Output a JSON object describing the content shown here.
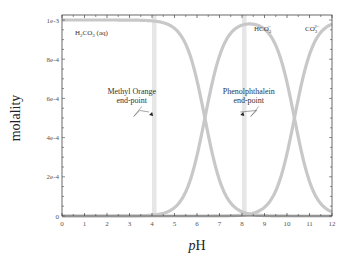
{
  "chart_data": {
    "type": "line",
    "title": "",
    "xlabel": "pH",
    "ylabel": "molality",
    "xlim": [
      0,
      12
    ],
    "ylim": [
      0,
      0.001
    ],
    "x_ticks": [
      "0",
      "1",
      "2",
      "3",
      "4",
      "5",
      "6",
      "7",
      "8",
      "9",
      "10",
      "11",
      "12"
    ],
    "y_ticks": [
      {
        "value": 0,
        "label": "0"
      },
      {
        "value": 0.0002,
        "label": "2e-4"
      },
      {
        "value": 0.0004,
        "label": "4e-4"
      },
      {
        "value": 0.0006,
        "label": "6e-4"
      },
      {
        "value": 0.0008,
        "label": "8e-4"
      },
      {
        "value": 0.001,
        "label": "1e-3"
      }
    ],
    "grid": false,
    "legend": "none (inline species labels)",
    "model": {
      "total_molality": 0.001,
      "pKa1": 6.35,
      "pKa2": 10.33
    },
    "series": [
      {
        "name": "H2CO3 (aq)",
        "label_main": "H",
        "label_sub1": "2",
        "label_mid": "CO",
        "label_sub2": "3",
        "label_tail": " (aq)",
        "x": [
          0,
          2,
          4,
          5,
          6,
          6.35,
          7,
          8,
          9,
          10,
          12
        ],
        "values": [
          0.001,
          0.001,
          0.000995,
          0.000957,
          0.000691,
          0.0005,
          0.000183,
          2.2e-05,
          2e-06,
          0,
          0
        ]
      },
      {
        "name": "HCO3-",
        "label_main": "HCO",
        "label_sub": "3",
        "label_sup": "−",
        "x": [
          0,
          4,
          5,
          6,
          6.35,
          7,
          8,
          9,
          10,
          10.33,
          11,
          12
        ],
        "values": [
          0,
          4e-06,
          4.3e-05,
          0.000309,
          0.0005,
          0.000815,
          0.000971,
          0.000953,
          0.000681,
          0.0005,
          0.000176,
          2.1e-05
        ]
      },
      {
        "name": "CO3 2-",
        "label_main": "CO",
        "label_sub": "3",
        "label_sup": "2−",
        "x": [
          0,
          8,
          9,
          10,
          10.33,
          11,
          12
        ],
        "values": [
          0,
          5e-06,
          4.5e-05,
          0.000319,
          0.0005,
          0.000824,
          0.000979
        ]
      }
    ],
    "bands": [
      {
        "name": "Methyl Orange end-point",
        "x_range": [
          4.0,
          4.2
        ]
      },
      {
        "name": "Phenolphthalein end-point",
        "x_range": [
          8.0,
          8.2
        ]
      }
    ],
    "annotations": [
      {
        "lines": [
          "Methyl Orange",
          "end-point"
        ],
        "text_x": 3.1,
        "text_y": 0.00062,
        "arrow_to": [
          4.05,
          0.00051
        ]
      },
      {
        "lines": [
          "Phenolphthalein",
          "end-point"
        ],
        "text_x": 8.3,
        "text_y": 0.00062,
        "arrow_to": [
          8.1,
          0.00051
        ]
      }
    ]
  },
  "colors": {
    "curve": "#c8c8c8",
    "band": "#e6e6e6",
    "axis": "#444444",
    "text": "#333333"
  }
}
